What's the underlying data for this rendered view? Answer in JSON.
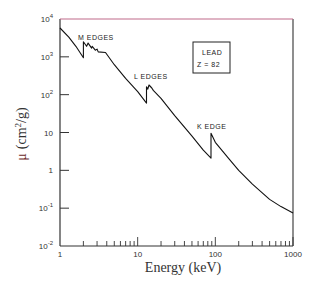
{
  "chart_data": {
    "type": "line",
    "title": "",
    "xlabel": "Energy (keV)",
    "ylabel": "μ (cm²/g)",
    "xscale": "log",
    "yscale": "log",
    "xlim": [
      1,
      1000
    ],
    "ylim": [
      0.01,
      10000
    ],
    "x_ticks": [
      {
        "value": 1,
        "label": "1"
      },
      {
        "value": 10,
        "label": "10"
      },
      {
        "value": 100,
        "label": "100"
      },
      {
        "value": 1000,
        "label": "1000"
      }
    ],
    "y_ticks": [
      {
        "value": 10000,
        "label": "10⁴",
        "base": "10",
        "exp": "4"
      },
      {
        "value": 1000,
        "label": "10³",
        "base": "10",
        "exp": "3"
      },
      {
        "value": 100,
        "label": "10²",
        "base": "10",
        "exp": "2"
      },
      {
        "value": 10,
        "label": "10",
        "base": "10",
        "exp": ""
      },
      {
        "value": 1,
        "label": "1",
        "base": "1",
        "exp": ""
      },
      {
        "value": 0.1,
        "label": "10⁻¹",
        "base": "10",
        "exp": "-1"
      },
      {
        "value": 0.01,
        "label": "10⁻²",
        "base": "10",
        "exp": "-2"
      }
    ],
    "grid": false,
    "legend": null,
    "series": [
      {
        "name": "Lead mass attenuation coefficient",
        "points": [
          [
            1.0,
            5800
          ],
          [
            1.3,
            3300
          ],
          [
            1.6,
            1900
          ],
          [
            2.0,
            950
          ],
          [
            2.0,
            2500
          ],
          [
            2.2,
            1900
          ],
          [
            2.3,
            2300
          ],
          [
            2.55,
            1700
          ],
          [
            2.6,
            1900
          ],
          [
            2.85,
            1500
          ],
          [
            3.0,
            1600
          ],
          [
            3.1,
            1350
          ],
          [
            3.85,
            1300
          ],
          [
            5.0,
            620
          ],
          [
            7.0,
            270
          ],
          [
            10.0,
            120
          ],
          [
            13.0,
            60
          ],
          [
            13.0,
            160
          ],
          [
            13.5,
            140
          ],
          [
            14.0,
            180
          ],
          [
            15.2,
            150
          ],
          [
            15.9,
            130
          ],
          [
            20.0,
            80
          ],
          [
            30.0,
            28
          ],
          [
            50.0,
            8.0
          ],
          [
            70.0,
            3.4
          ],
          [
            88.0,
            2.1
          ],
          [
            88.0,
            9.5
          ],
          [
            100.0,
            5.5
          ],
          [
            150.0,
            2.0
          ],
          [
            200.0,
            1.0
          ],
          [
            300.0,
            0.43
          ],
          [
            500.0,
            0.17
          ],
          [
            700.0,
            0.11
          ],
          [
            1000.0,
            0.075
          ]
        ],
        "color": "#111111"
      }
    ],
    "annotations": [
      {
        "text": "M EDGES",
        "x": 2.3,
        "y": 4200
      },
      {
        "text": "L EDGES",
        "x": 13.5,
        "y": 240
      },
      {
        "text": "K EDGE",
        "x": 85,
        "y": 14
      },
      {
        "text": "LEAD",
        "boxed": true
      },
      {
        "text": "Z = 82",
        "boxed": true
      }
    ]
  },
  "labels": {
    "m_edges": "M EDGES",
    "l_edges": "L EDGES",
    "k_edge": "K EDGE",
    "element": "LEAD",
    "atomic_number": "Z = 82",
    "x_axis_title": "Energy (keV)",
    "y_axis_mu": "μ",
    "y_axis_unit_prefix": "(cm",
    "y_axis_unit_exp": "2",
    "y_axis_unit_suffix": "/g)"
  },
  "colors": {
    "axis": "#333333",
    "top_border": "#c06a8a",
    "curve": "#111111",
    "y_title": "#6b2a2a"
  }
}
